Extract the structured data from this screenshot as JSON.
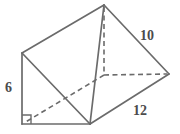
{
  "figure": {
    "name": "triangular-prism",
    "stroke_color": "#6b6b6b",
    "hidden_stroke_color": "#6b6b6b",
    "fill_color": "#ffffff",
    "label_color": "#4c4c4c",
    "background_color": "#ffffff"
  },
  "labels": {
    "height": "6",
    "slant": "10",
    "length": "12"
  },
  "geometry": {
    "vertices": {
      "back_top_apex": [
        104,
        5
      ],
      "front_top": [
        22,
        53
      ],
      "back_bottom_left": [
        104,
        75
      ],
      "back_bottom_right": [
        169,
        74
      ],
      "front_bottom_left": [
        22,
        124
      ],
      "front_bottom_right": [
        90,
        124
      ]
    },
    "solid_edges": [
      [
        [
          22,
          53
        ],
        [
          104,
          5
        ]
      ],
      [
        [
          104,
          5
        ],
        [
          169,
          74
        ]
      ],
      [
        [
          22,
          53
        ],
        [
          22,
          124
        ]
      ],
      [
        [
          22,
          124
        ],
        [
          90,
          124
        ]
      ],
      [
        [
          22,
          53
        ],
        [
          90,
          124
        ]
      ],
      [
        [
          90,
          124
        ],
        [
          169,
          74
        ]
      ],
      [
        [
          104,
          5
        ],
        [
          90,
          124
        ]
      ]
    ],
    "dashed_edges": [
      [
        [
          104,
          5
        ],
        [
          104,
          75
        ]
      ],
      [
        [
          104,
          75
        ],
        [
          169,
          74
        ]
      ],
      [
        [
          104,
          75
        ],
        [
          22,
          124
        ]
      ]
    ],
    "right_angle_marker": {
      "corner": [
        22,
        124
      ],
      "size": 9
    }
  }
}
